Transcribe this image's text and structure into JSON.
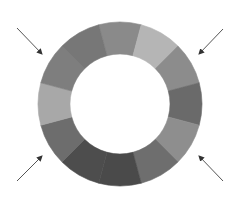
{
  "diagram": {
    "type": "segmented-ring",
    "center": [
      120,
      104
    ],
    "outer_radius": 82,
    "inner_radius": 50,
    "segments": [
      {
        "position": "12 o'clock",
        "color": "#8a8a8a"
      },
      {
        "position": "1 o'clock",
        "color": "#b5b5b5"
      },
      {
        "position": "2 o'clock",
        "color": "#8c8c8c"
      },
      {
        "position": "3 o'clock",
        "color": "#6a6a6a"
      },
      {
        "position": "4 o'clock",
        "color": "#8e8e8e"
      },
      {
        "position": "5 o'clock",
        "color": "#6e6e6e"
      },
      {
        "position": "6 o'clock",
        "color": "#4a4a4a"
      },
      {
        "position": "7 o'clock",
        "color": "#4d4d4d"
      },
      {
        "position": "8 o'clock",
        "color": "#6d6d6d"
      },
      {
        "position": "9 o'clock",
        "color": "#a8a8a8"
      },
      {
        "position": "10 o'clock",
        "color": "#7e7e7e"
      },
      {
        "position": "11 o'clock",
        "color": "#777777"
      }
    ],
    "arrows": [
      {
        "name": "arrow-top-left",
        "from": [
          17,
          28
        ],
        "to": [
          42,
          54
        ]
      },
      {
        "name": "arrow-top-right",
        "from": [
          223,
          29
        ],
        "to": [
          199,
          54
        ]
      },
      {
        "name": "arrow-bottom-left",
        "from": [
          17,
          181
        ],
        "to": [
          42,
          156
        ]
      },
      {
        "name": "arrow-bottom-right",
        "from": [
          223,
          181
        ],
        "to": [
          199,
          156
        ]
      }
    ],
    "arrow_color": "#555555"
  }
}
